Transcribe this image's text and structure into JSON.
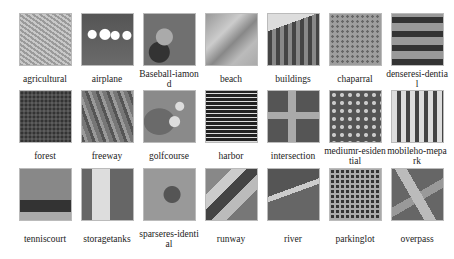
{
  "figure": {
    "rows": [
      [
        {
          "label": "agricultural",
          "texture": "agricultural-tile"
        },
        {
          "label": "airplane",
          "texture": "airplane-tile"
        },
        {
          "label": "Baseball-iamond",
          "texture": "baseball-tile"
        },
        {
          "label": "beach",
          "texture": "beach-tile"
        },
        {
          "label": "buildings",
          "texture": "buildings-tile"
        },
        {
          "label": "chaparral",
          "texture": "chaparral-tile"
        },
        {
          "label": "denseresi-dential",
          "texture": "denseresidential-tile"
        }
      ],
      [
        {
          "label": "forest",
          "texture": "forest-tile"
        },
        {
          "label": "freeway",
          "texture": "freeway-tile"
        },
        {
          "label": "golfcourse",
          "texture": "golfcourse-tile"
        },
        {
          "label": "harbor",
          "texture": "harbor-tile"
        },
        {
          "label": "intersection",
          "texture": "intersection-tile"
        },
        {
          "label": "mediumr-esidential",
          "texture": "mediumresidential-tile"
        },
        {
          "label": "mobileho-mepark",
          "texture": "mobilehomepark-tile"
        }
      ],
      [
        {
          "label": "tenniscourt",
          "texture": "tenniscourt-tile"
        },
        {
          "label": "storagetanks",
          "texture": "storagetanks-tile"
        },
        {
          "label": "sparseres-idential",
          "texture": "sparseresidential-tile"
        },
        {
          "label": "runway",
          "texture": "runway-tile"
        },
        {
          "label": "river",
          "texture": "river-tile"
        },
        {
          "label": "parkinglot",
          "texture": "parkinglot-tile"
        },
        {
          "label": "overpass",
          "texture": "overpass-tile"
        }
      ]
    ]
  }
}
